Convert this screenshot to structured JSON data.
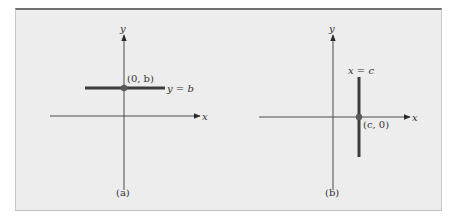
{
  "figure": {
    "colors": {
      "background": "#ededed",
      "axis": "#4a4a4a",
      "line": "#3d3d3d",
      "point": "#5a5a5a",
      "text": "#333333"
    },
    "panels": [
      {
        "id": "a",
        "caption": "(a)",
        "x_axis_label": "x",
        "y_axis_label": "y",
        "line_type": "horizontal",
        "equation_label": "y = b",
        "point_label": "(0, b)"
      },
      {
        "id": "b",
        "caption": "(b)",
        "x_axis_label": "x",
        "y_axis_label": "y",
        "line_type": "vertical",
        "equation_label": "x = c",
        "point_label": "(c, 0)"
      }
    ]
  }
}
